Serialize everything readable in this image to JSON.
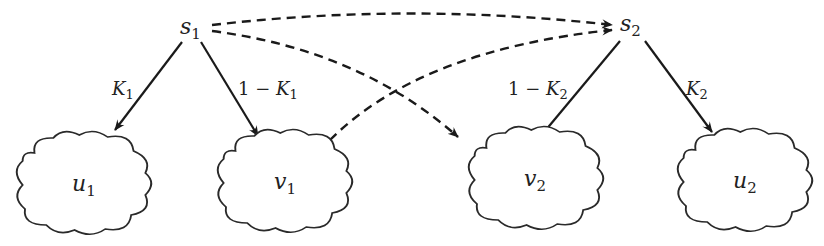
{
  "diagram": {
    "nodes": [
      {
        "id": "s1",
        "base": "s",
        "sub": "1",
        "shape": "text"
      },
      {
        "id": "s2",
        "base": "s",
        "sub": "2",
        "shape": "text"
      },
      {
        "id": "u1",
        "base": "u",
        "sub": "1",
        "shape": "cloud"
      },
      {
        "id": "v1",
        "base": "v",
        "sub": "1",
        "shape": "cloud"
      },
      {
        "id": "v2",
        "base": "v",
        "sub": "2",
        "shape": "cloud"
      },
      {
        "id": "u2",
        "base": "u",
        "sub": "2",
        "shape": "cloud"
      }
    ],
    "edges": [
      {
        "from": "s1",
        "to": "u1",
        "style": "solid",
        "label_prefix": "",
        "label_var": "K",
        "label_sub": "1"
      },
      {
        "from": "s1",
        "to": "v1",
        "style": "solid",
        "label_prefix": "1 − ",
        "label_var": "K",
        "label_sub": "1"
      },
      {
        "from": "s2",
        "to": "v2",
        "style": "solid",
        "label_prefix": "1 − ",
        "label_var": "K",
        "label_sub": "2"
      },
      {
        "from": "s2",
        "to": "u2",
        "style": "solid",
        "label_prefix": "",
        "label_var": "K",
        "label_sub": "2"
      },
      {
        "from": "s1",
        "to": "s2",
        "style": "dashed"
      },
      {
        "from": "s1",
        "to": "v2",
        "style": "dashed"
      },
      {
        "from": "v1",
        "to": "s2",
        "style": "dashed"
      }
    ],
    "colors": {
      "stroke": "#1a1a1a",
      "background": "#ffffff"
    }
  }
}
